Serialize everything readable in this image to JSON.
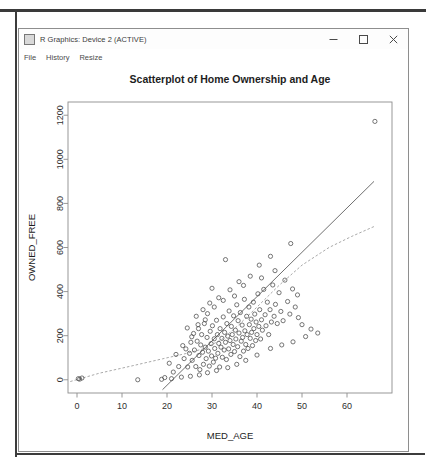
{
  "window": {
    "title": "R Graphics: Device 2 (ACTIVE)",
    "app_icon": "r-graphics-icon",
    "controls": {
      "minimize": "minimize-icon",
      "maximize": "maximize-icon",
      "close": "close-icon"
    }
  },
  "menu": {
    "items": [
      {
        "label": "File"
      },
      {
        "label": "History"
      },
      {
        "label": "Resize"
      }
    ]
  },
  "chart_data": {
    "type": "scatter",
    "title": "Scatterplot of Home Ownership and Age",
    "xlabel": "MED_AGE",
    "ylabel": "OWNED_FREE",
    "xlim": [
      -2,
      70
    ],
    "ylim": [
      -60,
      1260
    ],
    "xticks": [
      0,
      10,
      20,
      30,
      40,
      50,
      60
    ],
    "yticks": [
      0,
      200,
      400,
      600,
      800,
      1000,
      1200
    ],
    "grid": false,
    "legend": "none",
    "marker": "open-circle",
    "marker_color": "#4a4a4a",
    "series": [
      {
        "name": "observations",
        "points": [
          [
            0.3,
            5
          ],
          [
            0.6,
            3
          ],
          [
            1.1,
            8
          ],
          [
            13.5,
            0
          ],
          [
            18.8,
            2
          ],
          [
            19.5,
            10
          ],
          [
            21.0,
            5
          ],
          [
            21.4,
            35
          ],
          [
            22.6,
            60
          ],
          [
            23.2,
            12
          ],
          [
            23.8,
            96
          ],
          [
            24.2,
            140
          ],
          [
            24.6,
            58
          ],
          [
            25.0,
            120
          ],
          [
            25.3,
            170
          ],
          [
            25.6,
            88
          ],
          [
            25.9,
            210
          ],
          [
            26.1,
            135
          ],
          [
            26.4,
            60
          ],
          [
            26.7,
            175
          ],
          [
            26.9,
            250
          ],
          [
            27.1,
            110
          ],
          [
            27.3,
            46
          ],
          [
            27.5,
            158
          ],
          [
            27.7,
            205
          ],
          [
            27.9,
            125
          ],
          [
            28.1,
            70
          ],
          [
            28.3,
            255
          ],
          [
            28.5,
            148
          ],
          [
            28.7,
            96
          ],
          [
            28.9,
            192
          ],
          [
            29.0,
            300
          ],
          [
            29.2,
            130
          ],
          [
            29.4,
            62
          ],
          [
            29.6,
            220
          ],
          [
            29.8,
            164
          ],
          [
            29.9,
            108
          ],
          [
            30.1,
            245
          ],
          [
            30.3,
            80
          ],
          [
            30.5,
            186
          ],
          [
            30.6,
            142
          ],
          [
            30.8,
            98
          ],
          [
            31.0,
            270
          ],
          [
            31.2,
            205
          ],
          [
            31.3,
            120
          ],
          [
            31.5,
            165
          ],
          [
            31.7,
            58
          ],
          [
            31.8,
            232
          ],
          [
            32.0,
            148
          ],
          [
            32.2,
            188
          ],
          [
            32.3,
            102
          ],
          [
            32.5,
            285
          ],
          [
            32.7,
            135
          ],
          [
            32.8,
            215
          ],
          [
            33.0,
            170
          ],
          [
            33.2,
            92
          ],
          [
            33.3,
            255
          ],
          [
            33.5,
            198
          ],
          [
            33.7,
            140
          ],
          [
            33.8,
            312
          ],
          [
            34.0,
            178
          ],
          [
            34.2,
            115
          ],
          [
            34.3,
            242
          ],
          [
            34.5,
            205
          ],
          [
            34.7,
            160
          ],
          [
            34.8,
            290
          ],
          [
            35.0,
            128
          ],
          [
            35.2,
            225
          ],
          [
            35.3,
            185
          ],
          [
            35.5,
            340
          ],
          [
            35.7,
            150
          ],
          [
            35.8,
            268
          ],
          [
            36.0,
            212
          ],
          [
            36.2,
            105
          ],
          [
            36.3,
            305
          ],
          [
            36.5,
            175
          ],
          [
            36.7,
            248
          ],
          [
            36.8,
            192
          ],
          [
            37.0,
            130
          ],
          [
            37.2,
            365
          ],
          [
            37.3,
            222
          ],
          [
            37.5,
            160
          ],
          [
            37.7,
            288
          ],
          [
            37.8,
            205
          ],
          [
            38.0,
            142
          ],
          [
            38.2,
            330
          ],
          [
            38.3,
            250
          ],
          [
            38.5,
            188
          ],
          [
            38.7,
            275
          ],
          [
            38.8,
            215
          ],
          [
            39.0,
            155
          ],
          [
            39.2,
            352
          ],
          [
            39.3,
            232
          ],
          [
            39.5,
            298
          ],
          [
            39.7,
            178
          ],
          [
            39.8,
            262
          ],
          [
            40.0,
            205
          ],
          [
            40.2,
            390
          ],
          [
            40.4,
            242
          ],
          [
            40.6,
            318
          ],
          [
            40.8,
            185
          ],
          [
            41.0,
            272
          ],
          [
            41.2,
            225
          ],
          [
            41.5,
            410
          ],
          [
            41.8,
            295
          ],
          [
            42.0,
            245
          ],
          [
            42.3,
            352
          ],
          [
            42.6,
            205
          ],
          [
            42.9,
            318
          ],
          [
            43.2,
            262
          ],
          [
            43.5,
            430
          ],
          [
            43.8,
            288
          ],
          [
            44.1,
            342
          ],
          [
            44.5,
            255
          ],
          [
            44.9,
            395
          ],
          [
            45.3,
            310
          ],
          [
            45.8,
            268
          ],
          [
            46.2,
            452
          ],
          [
            46.8,
            355
          ],
          [
            47.3,
            298
          ],
          [
            47.9,
            412
          ],
          [
            48.5,
            330
          ],
          [
            49.2,
            282
          ],
          [
            50.0,
            250
          ],
          [
            50.8,
            196
          ],
          [
            43.0,
            560
          ],
          [
            40.5,
            520
          ],
          [
            38.5,
            470
          ],
          [
            36.0,
            445
          ],
          [
            34.0,
            408
          ],
          [
            31.5,
            372
          ],
          [
            29.5,
            348
          ],
          [
            28.0,
            318
          ],
          [
            33.0,
            545
          ],
          [
            30.0,
            415
          ],
          [
            26.5,
            288
          ],
          [
            24.5,
            235
          ],
          [
            47.5,
            618
          ],
          [
            44.0,
            495
          ],
          [
            41.0,
            462
          ],
          [
            37.0,
            428
          ],
          [
            35.0,
            380
          ],
          [
            32.5,
            360
          ],
          [
            30.5,
            330
          ],
          [
            28.5,
            272
          ],
          [
            27.0,
            232
          ],
          [
            25.5,
            195
          ],
          [
            23.5,
            155
          ],
          [
            22.0,
            115
          ],
          [
            20.5,
            75
          ],
          [
            49.0,
            385
          ],
          [
            52.0,
            230
          ],
          [
            53.5,
            212
          ],
          [
            48.0,
            172
          ],
          [
            45.5,
            158
          ],
          [
            43.0,
            142
          ],
          [
            40.0,
            112
          ],
          [
            37.5,
            88
          ],
          [
            35.5,
            70
          ],
          [
            33.5,
            55
          ],
          [
            31.0,
            42
          ],
          [
            29.0,
            32
          ],
          [
            27.2,
            22
          ],
          [
            25.2,
            16
          ],
          [
            66.2,
            1172
          ]
        ]
      }
    ],
    "trend_lines": [
      {
        "name": "linear-regression",
        "style": "solid-dark",
        "color": "#555555",
        "path": [
          [
            19.0,
            -45
          ],
          [
            66.0,
            900
          ]
        ]
      },
      {
        "name": "lowess-smoother",
        "style": "dashed-light",
        "color": "#9a9a9a",
        "path": [
          [
            -1.5,
            -8
          ],
          [
            5,
            30
          ],
          [
            12,
            62
          ],
          [
            19,
            95
          ],
          [
            24,
            118
          ],
          [
            28,
            140
          ],
          [
            32,
            180
          ],
          [
            36,
            250
          ],
          [
            40,
            330
          ],
          [
            45,
            430
          ],
          [
            50,
            520
          ],
          [
            56,
            600
          ],
          [
            61,
            650
          ],
          [
            66,
            695
          ]
        ]
      }
    ]
  }
}
